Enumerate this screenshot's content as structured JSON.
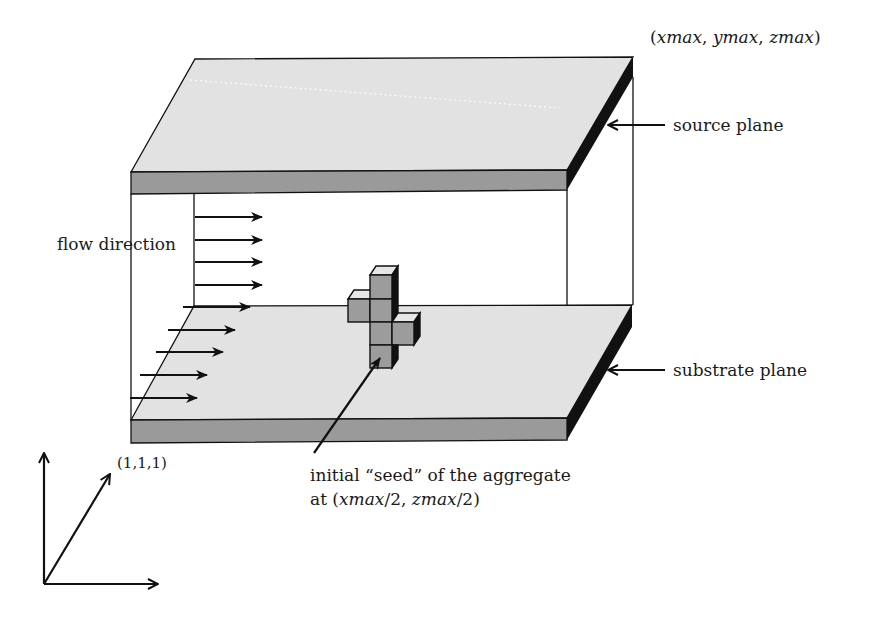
{
  "diagram": {
    "colors": {
      "plane_top": "#e2e2e2",
      "plane_front": "#9a9a9a",
      "plane_side": "#111111",
      "cube_front": "#9c9c9c",
      "cube_top": "#e6e6e6",
      "cube_side": "#111111",
      "line": "#111111"
    },
    "labels": {
      "corner_max": "(xmax, ymax, zmax)",
      "source_plane": "source plane",
      "substrate_plane": "substrate plane",
      "flow_direction": "flow direction",
      "seed_line1": "initial “seed” of the aggregate",
      "seed_line2_prefix": "at (",
      "seed_line2_italic1": "xmax",
      "seed_line2_mid": "/2, ",
      "seed_line2_italic2": "zmax",
      "seed_line2_suffix": "/2)",
      "origin": "(1,1,1)"
    },
    "corner_max_parts": {
      "open": "(",
      "x": "xmax",
      "sep1": ", ",
      "y": "ymax",
      "sep2": ", ",
      "z": "zmax",
      "close": ")"
    },
    "flow_arrows": {
      "count": 10,
      "upper_count": 5,
      "lower_count": 5
    },
    "aggregate_seed": {
      "cube_count": 6,
      "arrangement": "plus-shaped cluster of unit cubes"
    },
    "axes": {
      "origin_label": "(1,1,1)",
      "axis_count": 3
    }
  }
}
